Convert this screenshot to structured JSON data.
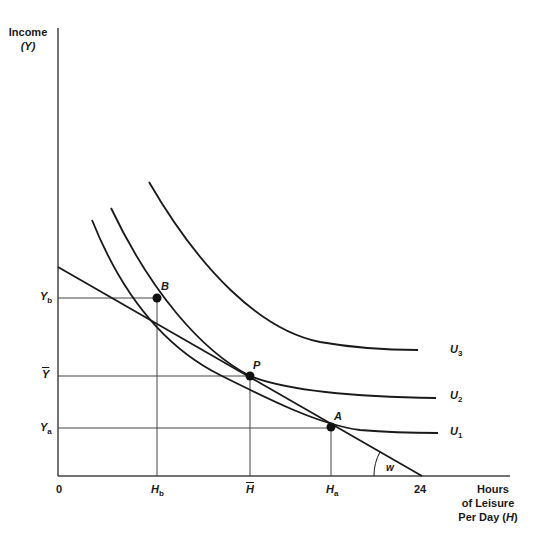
{
  "diagram": {
    "y_axis": {
      "title_line1": "Income",
      "title_line2": "(Y)",
      "ticks": [
        {
          "main": "Y",
          "sub": "b"
        },
        {
          "main": "Y",
          "overline": true
        },
        {
          "main": "Y",
          "sub": "a"
        }
      ]
    },
    "x_axis": {
      "origin": "0",
      "ticks": [
        {
          "main": "H",
          "sub": "b"
        },
        {
          "main": "H",
          "overline": true
        },
        {
          "main": "H",
          "sub": "a"
        },
        {
          "main": "24"
        }
      ],
      "title_line1": "Hours",
      "title_line2": "of Leisure",
      "title_line3_prefix": "Per Day (",
      "title_line3_var": "H",
      "title_line3_suffix": ")"
    },
    "points": [
      {
        "label": "B"
      },
      {
        "label": "P"
      },
      {
        "label": "A"
      }
    ],
    "curves": [
      {
        "main": "U",
        "sub": "3"
      },
      {
        "main": "U",
        "sub": "2"
      },
      {
        "main": "U",
        "sub": "1"
      }
    ],
    "angle_label": "w",
    "colors": {
      "line": "#1a1a1a",
      "axis": "#444444",
      "background": "#ffffff"
    }
  }
}
